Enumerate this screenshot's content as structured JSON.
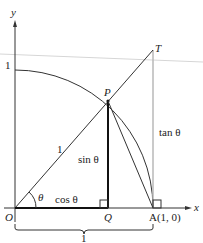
{
  "diagram": {
    "theta": 0.9,
    "labels": {
      "y_axis": "y",
      "x_axis": "x",
      "one_on_y_axis": "1",
      "point_T": "T",
      "point_P": "P",
      "point_O": "O",
      "point_Q": "Q",
      "point_A": "A(1, 0)",
      "radius": "1",
      "angle": "θ",
      "sin": "sin θ",
      "cos": "cos θ",
      "tan": "tan θ",
      "brace": "1"
    },
    "colors": {
      "line": "#333333",
      "thick": "#111111",
      "tan_line": "#b8b8b8",
      "guide_line": "#cfcfcf"
    }
  }
}
